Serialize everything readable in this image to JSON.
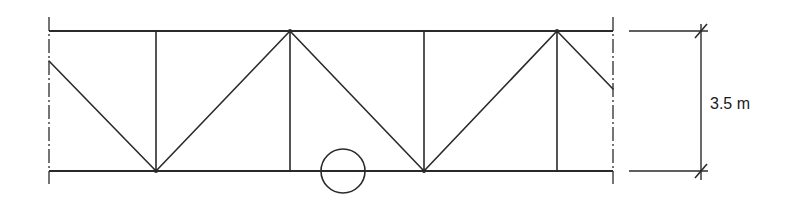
{
  "diagram": {
    "type": "truss-elevation",
    "height_label": "3.5 m",
    "colors": {
      "line": "#2a2a2a",
      "background": "#ffffff"
    },
    "chords": {
      "top_y": 31,
      "bottom_y": 171,
      "x_start": 49,
      "x_end": 613
    },
    "centerlines": [
      {
        "x": 49,
        "y1": 17,
        "y2": 184
      },
      {
        "x": 613,
        "y1": 17,
        "y2": 184
      }
    ],
    "verticals": [
      156,
      290,
      424,
      557
    ],
    "diagonals": [
      {
        "x1": 49,
        "y1": 61,
        "x2": 156,
        "y2": 171
      },
      {
        "x1": 156,
        "y1": 171,
        "x2": 290,
        "y2": 31
      },
      {
        "x1": 290,
        "y1": 31,
        "x2": 424,
        "y2": 171
      },
      {
        "x1": 424,
        "y1": 171,
        "x2": 557,
        "y2": 31
      },
      {
        "x1": 557,
        "y1": 31,
        "x2": 613,
        "y2": 89
      }
    ],
    "circle": {
      "cx": 343,
      "cy": 171,
      "r": 22
    },
    "dimension": {
      "x": 701,
      "y_top": 31,
      "y_bottom": 171,
      "ext_x1": 629,
      "ext_x2": 708,
      "label_x": 710,
      "label_y": 109
    }
  }
}
